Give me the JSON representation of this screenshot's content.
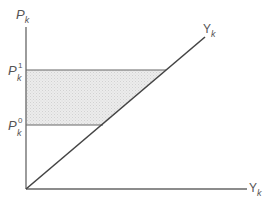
{
  "diagram": {
    "y_axis_label": {
      "main": "P",
      "sub": "k"
    },
    "x_axis_label": {
      "main": "Y",
      "sub": "k"
    },
    "diagonal_label": {
      "main": "Y",
      "sub": "k"
    },
    "level_high": {
      "main": "P",
      "sub": "k",
      "sup": "1"
    },
    "level_low": {
      "main": "P",
      "sub": "k",
      "sup": "0"
    },
    "shaded_region": "between P_k^0 and P_k^1, left of the 45-degree line",
    "colors": {
      "axis": "#666666",
      "diagonal": "#444444",
      "shade": "#e4e4e4",
      "text": "#555555"
    }
  }
}
